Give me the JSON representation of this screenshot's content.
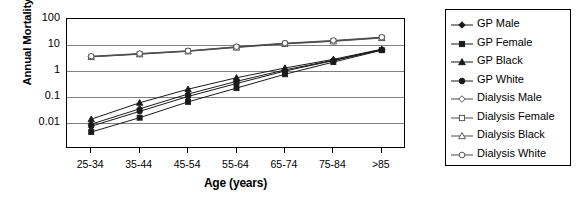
{
  "chart_data": {
    "type": "line",
    "title": "",
    "xlabel": "Age (years)",
    "ylabel": "Annual Mortality (%)",
    "categories": [
      "25-34",
      "35-44",
      "45-54",
      "55-64",
      "65-74",
      "75-84",
      ">85"
    ],
    "yscale": "log",
    "ylim": [
      0.001,
      100
    ],
    "yticks": [
      "100",
      "10",
      "1",
      "0.1",
      "0.01"
    ],
    "ytick_values": [
      100,
      10,
      1,
      0.1,
      0.01
    ],
    "grid": true,
    "legend_position": "right",
    "series": [
      {
        "name": "GP Male",
        "marker": "diamond-filled",
        "values": [
          0.009,
          0.035,
          0.13,
          0.4,
          1.1,
          2.6,
          6.7
        ]
      },
      {
        "name": "GP Female",
        "marker": "square-filled",
        "values": [
          0.0045,
          0.016,
          0.065,
          0.22,
          0.75,
          2.2,
          6.3
        ]
      },
      {
        "name": "GP Black",
        "marker": "triangle-filled",
        "values": [
          0.014,
          0.06,
          0.2,
          0.55,
          1.3,
          2.8,
          6.9
        ]
      },
      {
        "name": "GP White",
        "marker": "circle-filled",
        "values": [
          0.0075,
          0.028,
          0.105,
          0.33,
          1.0,
          2.5,
          6.5
        ]
      },
      {
        "name": "Dialysis Male",
        "marker": "diamond-open",
        "values": [
          3.6,
          4.6,
          5.9,
          8.4,
          11.5,
          14.5,
          19.5
        ]
      },
      {
        "name": "Dialysis Female",
        "marker": "square-open",
        "values": [
          3.5,
          4.5,
          5.8,
          8.2,
          11.2,
          14.2,
          19.0
        ]
      },
      {
        "name": "Dialysis Black",
        "marker": "triangle-open",
        "values": [
          3.5,
          4.4,
          5.7,
          8.0,
          11.0,
          13.8,
          18.5
        ]
      },
      {
        "name": "Dialysis White",
        "marker": "circle-open",
        "values": [
          3.7,
          4.7,
          6.0,
          8.6,
          11.8,
          15.0,
          20.0
        ]
      }
    ],
    "colors": {
      "axis": "#000000",
      "grid": "#808080",
      "gp": "#1a1a1a",
      "dialysis": "#4d4d4d"
    }
  },
  "legend": {
    "items": [
      {
        "label": "GP Male",
        "icon": "diamond-filled-marker-icon"
      },
      {
        "label": "GP Female",
        "icon": "square-filled-marker-icon"
      },
      {
        "label": "GP Black",
        "icon": "triangle-filled-marker-icon"
      },
      {
        "label": "GP White",
        "icon": "circle-filled-marker-icon"
      },
      {
        "label": "Dialysis Male",
        "icon": "diamond-open-marker-icon"
      },
      {
        "label": "Dialysis Female",
        "icon": "square-open-marker-icon"
      },
      {
        "label": "Dialysis Black",
        "icon": "triangle-open-marker-icon"
      },
      {
        "label": "Dialysis White",
        "icon": "circle-open-marker-icon"
      }
    ]
  }
}
